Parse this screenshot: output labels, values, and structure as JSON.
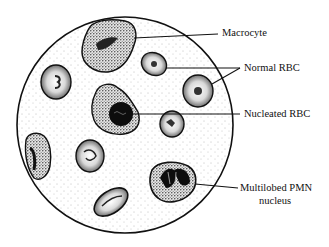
{
  "figure": {
    "colors": {
      "ink": "#111111",
      "background": "#ffffff",
      "cell_fill": "#f2f2f2",
      "stipple": "#555555"
    },
    "field_of_view": {
      "cx": 125,
      "cy": 125,
      "r": 108
    },
    "labels": {
      "macrocyte": "Macrocyte",
      "normal_rbc": "Normal RBC",
      "nucleated_rbc": "Nucleated RBC",
      "pmn_line1": "Multilobed PMN",
      "pmn_line2": "nucleus"
    }
  }
}
